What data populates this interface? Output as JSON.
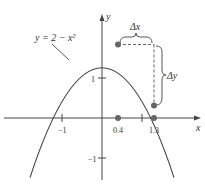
{
  "diagram": {
    "type": "function-graph",
    "function_label": "y = 2 − x²",
    "axes": {
      "x_label": "x",
      "y_label": "y",
      "x_ticks": [
        {
          "value": -1,
          "label": "−1"
        },
        {
          "value": 1,
          "label": ""
        }
      ],
      "y_ticks": [
        {
          "value": 1,
          "label": "1"
        },
        {
          "value": -1,
          "label": "−1"
        }
      ]
    },
    "marked_x_values": [
      {
        "value": 0.4,
        "label": "0.4"
      },
      {
        "value": 1.3,
        "label": "1.3"
      }
    ],
    "points": [
      {
        "x": 0.4,
        "y": 1.84
      },
      {
        "x": 1.3,
        "y": 0.31
      }
    ],
    "annotations": {
      "delta_x": "Δx",
      "delta_y": "Δy"
    },
    "colors": {
      "curve": "#444444",
      "points": "#666666",
      "axes": "#444444"
    }
  }
}
